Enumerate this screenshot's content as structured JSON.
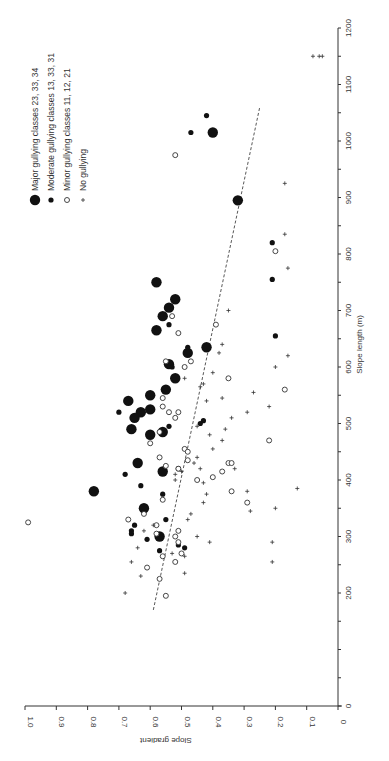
{
  "chart_data": {
    "type": "scatter",
    "orientation_note": "figure printed rotated 90 degrees clockwise",
    "title": "",
    "xlabel": "Slope length (m)",
    "ylabel": "Slope gradient",
    "xlim": [
      0,
      1200
    ],
    "ylim": [
      0,
      1.0
    ],
    "x_ticks": [
      "0",
      "200",
      "300",
      "400",
      "500",
      "600",
      "700",
      "800",
      "900",
      "1000",
      "1100",
      "1200"
    ],
    "x_tick_values": [
      0,
      200,
      300,
      400,
      500,
      600,
      700,
      800,
      900,
      1000,
      1100,
      1200
    ],
    "y_ticks": [
      "0",
      "0.1",
      "0.2",
      "0.3",
      "0.4",
      "0.5",
      "0.6",
      "0.7",
      "0.8",
      "0.9",
      "1.0"
    ],
    "y_tick_values": [
      0,
      0.1,
      0.2,
      0.3,
      0.4,
      0.5,
      0.6,
      0.7,
      0.8,
      0.9,
      1.0
    ],
    "grid": false,
    "legend_position": "upper-left (rotated)",
    "legend": [
      {
        "label": "Major gullying classes 23, 33, 34",
        "marker": "large-filled-circle"
      },
      {
        "label": "Moderate gullying classes 13, 33, 31",
        "marker": "small-filled-circle"
      },
      {
        "label": "Minor gullying classes 11, 12, 21",
        "marker": "open-circle"
      },
      {
        "label": "No gullying",
        "marker": "plus"
      }
    ],
    "trend_line": {
      "style": "dashed",
      "points": [
        [
          170,
          0.59
        ],
        [
          1060,
          0.25
        ]
      ]
    },
    "series": [
      {
        "name": "Major gullying classes 23, 33, 34",
        "points": [
          [
            1015,
            0.4
          ],
          [
            895,
            0.32
          ],
          [
            750,
            0.58
          ],
          [
            720,
            0.52
          ],
          [
            705,
            0.54
          ],
          [
            690,
            0.56
          ],
          [
            665,
            0.58
          ],
          [
            635,
            0.42
          ],
          [
            625,
            0.48
          ],
          [
            605,
            0.54
          ],
          [
            580,
            0.52
          ],
          [
            560,
            0.55
          ],
          [
            550,
            0.6
          ],
          [
            540,
            0.67
          ],
          [
            525,
            0.6
          ],
          [
            520,
            0.63
          ],
          [
            510,
            0.65
          ],
          [
            485,
            0.56
          ],
          [
            490,
            0.66
          ],
          [
            480,
            0.6
          ],
          [
            430,
            0.64
          ],
          [
            415,
            0.56
          ],
          [
            380,
            0.78
          ],
          [
            350,
            0.62
          ],
          [
            300,
            0.57
          ]
        ]
      },
      {
        "name": "Moderate gullying classes 13, 33, 31",
        "points": [
          [
            1045,
            0.42
          ],
          [
            1015,
            0.47
          ],
          [
            820,
            0.21
          ],
          [
            755,
            0.21
          ],
          [
            675,
            0.54
          ],
          [
            655,
            0.2
          ],
          [
            635,
            0.48
          ],
          [
            600,
            0.53
          ],
          [
            520,
            0.7
          ],
          [
            505,
            0.43
          ],
          [
            500,
            0.44
          ],
          [
            495,
            0.54
          ],
          [
            420,
            0.51
          ],
          [
            410,
            0.68
          ],
          [
            390,
            0.63
          ],
          [
            375,
            0.56
          ],
          [
            330,
            0.55
          ],
          [
            320,
            0.65
          ],
          [
            310,
            0.66
          ],
          [
            305,
            0.66
          ],
          [
            295,
            0.61
          ],
          [
            285,
            0.51
          ],
          [
            280,
            0.49
          ],
          [
            275,
            0.57
          ]
        ]
      },
      {
        "name": "Minor gullying classes 11, 12, 21",
        "points": [
          [
            975,
            0.52
          ],
          [
            805,
            0.2
          ],
          [
            690,
            0.53
          ],
          [
            675,
            0.39
          ],
          [
            660,
            0.51
          ],
          [
            610,
            0.55
          ],
          [
            610,
            0.47
          ],
          [
            600,
            0.49
          ],
          [
            580,
            0.35
          ],
          [
            560,
            0.17
          ],
          [
            545,
            0.56
          ],
          [
            530,
            0.56
          ],
          [
            520,
            0.54
          ],
          [
            520,
            0.51
          ],
          [
            510,
            0.52
          ],
          [
            485,
            0.57
          ],
          [
            470,
            0.22
          ],
          [
            465,
            0.6
          ],
          [
            455,
            0.49
          ],
          [
            450,
            0.48
          ],
          [
            440,
            0.57
          ],
          [
            435,
            0.48
          ],
          [
            430,
            0.35
          ],
          [
            430,
            0.34
          ],
          [
            425,
            0.55
          ],
          [
            420,
            0.51
          ],
          [
            415,
            0.37
          ],
          [
            405,
            0.4
          ],
          [
            400,
            0.45
          ],
          [
            380,
            0.34
          ],
          [
            365,
            0.56
          ],
          [
            360,
            0.29
          ],
          [
            340,
            0.62
          ],
          [
            330,
            0.67
          ],
          [
            320,
            0.58
          ],
          [
            310,
            0.51
          ],
          [
            305,
            0.58
          ],
          [
            300,
            0.52
          ],
          [
            290,
            0.51
          ],
          [
            270,
            0.5
          ],
          [
            265,
            0.56
          ],
          [
            255,
            0.52
          ],
          [
            245,
            0.61
          ],
          [
            225,
            0.57
          ],
          [
            195,
            0.55
          ],
          [
            325,
            0.99
          ]
        ]
      },
      {
        "name": "No gullying",
        "points": [
          [
            1150,
            0.08
          ],
          [
            1150,
            0.06
          ],
          [
            1150,
            0.05
          ],
          [
            925,
            0.17
          ],
          [
            835,
            0.17
          ],
          [
            775,
            0.16
          ],
          [
            700,
            0.35
          ],
          [
            640,
            0.37
          ],
          [
            625,
            0.38
          ],
          [
            620,
            0.16
          ],
          [
            600,
            0.2
          ],
          [
            590,
            0.4
          ],
          [
            580,
            0.49
          ],
          [
            570,
            0.43
          ],
          [
            565,
            0.44
          ],
          [
            555,
            0.27
          ],
          [
            545,
            0.37
          ],
          [
            540,
            0.42
          ],
          [
            530,
            0.22
          ],
          [
            520,
            0.29
          ],
          [
            510,
            0.34
          ],
          [
            495,
            0.45
          ],
          [
            490,
            0.36
          ],
          [
            480,
            0.41
          ],
          [
            470,
            0.37
          ],
          [
            455,
            0.4
          ],
          [
            440,
            0.45
          ],
          [
            430,
            0.46
          ],
          [
            420,
            0.33
          ],
          [
            420,
            0.44
          ],
          [
            415,
            0.5
          ],
          [
            410,
            0.52
          ],
          [
            400,
            0.52
          ],
          [
            395,
            0.43
          ],
          [
            385,
            0.13
          ],
          [
            380,
            0.29
          ],
          [
            375,
            0.42
          ],
          [
            360,
            0.43
          ],
          [
            350,
            0.2
          ],
          [
            345,
            0.28
          ],
          [
            340,
            0.47
          ],
          [
            330,
            0.48
          ],
          [
            320,
            0.59
          ],
          [
            310,
            0.62
          ],
          [
            300,
            0.45
          ],
          [
            290,
            0.41
          ],
          [
            290,
            0.21
          ],
          [
            280,
            0.64
          ],
          [
            270,
            0.53
          ],
          [
            265,
            0.49
          ],
          [
            255,
            0.21
          ],
          [
            255,
            0.66
          ],
          [
            235,
            0.49
          ],
          [
            230,
            0.63
          ],
          [
            200,
            0.68
          ]
        ]
      }
    ]
  }
}
